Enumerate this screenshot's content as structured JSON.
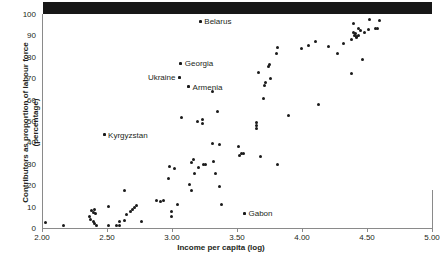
{
  "chart_data": {
    "type": "scatter",
    "title": "",
    "xlabel": "Income per capita (log)",
    "ylabel_line1": "Contributors as proportion of labour force",
    "ylabel_line2": "(percentage)",
    "xlim": [
      2.0,
      5.0
    ],
    "ylim": [
      0,
      100
    ],
    "xticks": [
      "2.00",
      "2.50",
      "3.00",
      "3.50",
      "4.00",
      "4.50",
      "5.00"
    ],
    "xtick_values": [
      2.0,
      2.5,
      3.0,
      3.5,
      4.0,
      4.5,
      5.0
    ],
    "yticks": [
      "0",
      "10",
      "20",
      "30",
      "40",
      "50",
      "60",
      "70",
      "80",
      "90",
      "100"
    ],
    "ytick_values": [
      0,
      10,
      20,
      30,
      40,
      50,
      60,
      70,
      80,
      90,
      100
    ],
    "grid": false,
    "legend": false,
    "marker_color": "#1a1a1a",
    "axis_color": "#8a8a8a",
    "annotations": [
      {
        "label": "Belarus",
        "x": 3.21,
        "y": 96.5,
        "side": "left"
      },
      {
        "label": "Georgia",
        "x": 3.06,
        "y": 77.0,
        "side": "left"
      },
      {
        "label": "Ukraine",
        "x": 3.05,
        "y": 70.5,
        "side": "right"
      },
      {
        "label": "Armenia",
        "x": 3.12,
        "y": 66.0,
        "side": "left"
      },
      {
        "label": "Kyrgyzstan",
        "x": 2.47,
        "y": 43.5,
        "side": "left"
      },
      {
        "label": "Gabon",
        "x": 3.55,
        "y": 7.0,
        "side": "left"
      }
    ],
    "points": [
      {
        "x": 2.02,
        "y": 2.8
      },
      {
        "x": 2.16,
        "y": 1.2
      },
      {
        "x": 2.355,
        "y": 5.2
      },
      {
        "x": 2.365,
        "y": 4.0
      },
      {
        "x": 2.375,
        "y": 8.2
      },
      {
        "x": 2.385,
        "y": 7.3
      },
      {
        "x": 2.385,
        "y": 3.2
      },
      {
        "x": 2.395,
        "y": 8.6
      },
      {
        "x": 2.395,
        "y": 2.3
      },
      {
        "x": 2.4,
        "y": 6.8
      },
      {
        "x": 2.41,
        "y": 1.0
      },
      {
        "x": 2.47,
        "y": 43.5
      },
      {
        "x": 2.5,
        "y": 9.9
      },
      {
        "x": 2.505,
        "y": 1.4
      },
      {
        "x": 2.565,
        "y": 1.2
      },
      {
        "x": 2.585,
        "y": 3.0
      },
      {
        "x": 2.59,
        "y": 1.1
      },
      {
        "x": 2.625,
        "y": 17.6
      },
      {
        "x": 2.625,
        "y": 3.6
      },
      {
        "x": 2.64,
        "y": 6.4
      },
      {
        "x": 2.675,
        "y": 7.9
      },
      {
        "x": 2.69,
        "y": 8.6
      },
      {
        "x": 2.705,
        "y": 9.4
      },
      {
        "x": 2.72,
        "y": 10.3
      },
      {
        "x": 2.755,
        "y": 3.1
      },
      {
        "x": 2.875,
        "y": 12.8
      },
      {
        "x": 2.9,
        "y": 12.6
      },
      {
        "x": 2.925,
        "y": 12.8
      },
      {
        "x": 2.965,
        "y": 23.3
      },
      {
        "x": 2.975,
        "y": 28.6
      },
      {
        "x": 2.985,
        "y": 7.6
      },
      {
        "x": 2.99,
        "y": 5.3
      },
      {
        "x": 3.015,
        "y": 27.9
      },
      {
        "x": 3.035,
        "y": 11.2
      },
      {
        "x": 3.06,
        "y": 77.0
      },
      {
        "x": 3.065,
        "y": 51.7
      },
      {
        "x": 3.05,
        "y": 70.5
      },
      {
        "x": 3.12,
        "y": 66.0
      },
      {
        "x": 3.125,
        "y": 20.4
      },
      {
        "x": 3.14,
        "y": 30.5
      },
      {
        "x": 3.145,
        "y": 17.3
      },
      {
        "x": 3.16,
        "y": 31.8
      },
      {
        "x": 3.165,
        "y": 25.5
      },
      {
        "x": 3.19,
        "y": 49.6
      },
      {
        "x": 3.195,
        "y": 28.5
      },
      {
        "x": 3.21,
        "y": 96.5
      },
      {
        "x": 3.225,
        "y": 50.8
      },
      {
        "x": 3.23,
        "y": 48.7
      },
      {
        "x": 3.235,
        "y": 29.5
      },
      {
        "x": 3.25,
        "y": 29.8
      },
      {
        "x": 3.305,
        "y": 63.9
      },
      {
        "x": 3.305,
        "y": 39.5
      },
      {
        "x": 3.31,
        "y": 30.9
      },
      {
        "x": 3.325,
        "y": 25.4
      },
      {
        "x": 3.34,
        "y": 54.6
      },
      {
        "x": 3.355,
        "y": 38.8
      },
      {
        "x": 3.36,
        "y": 19.6
      },
      {
        "x": 3.375,
        "y": 11.1
      },
      {
        "x": 3.5,
        "y": 38.2
      },
      {
        "x": 3.51,
        "y": 33.8
      },
      {
        "x": 3.53,
        "y": 35.0
      },
      {
        "x": 3.545,
        "y": 35.0
      },
      {
        "x": 3.55,
        "y": 7.0
      },
      {
        "x": 3.645,
        "y": 49.3
      },
      {
        "x": 3.645,
        "y": 47.8
      },
      {
        "x": 3.645,
        "y": 46.6
      },
      {
        "x": 3.655,
        "y": 72.6
      },
      {
        "x": 3.675,
        "y": 33.5
      },
      {
        "x": 3.695,
        "y": 60.5
      },
      {
        "x": 3.705,
        "y": 66.5
      },
      {
        "x": 3.715,
        "y": 68.0
      },
      {
        "x": 3.735,
        "y": 75.6
      },
      {
        "x": 3.745,
        "y": 76.2
      },
      {
        "x": 3.75,
        "y": 69.7
      },
      {
        "x": 3.795,
        "y": 81.7
      },
      {
        "x": 3.8,
        "y": 84.4
      },
      {
        "x": 3.805,
        "y": 29.5
      },
      {
        "x": 3.89,
        "y": 52.6
      },
      {
        "x": 3.985,
        "y": 83.7
      },
      {
        "x": 4.04,
        "y": 85.5
      },
      {
        "x": 4.095,
        "y": 87.3
      },
      {
        "x": 4.12,
        "y": 57.6
      },
      {
        "x": 4.195,
        "y": 84.9
      },
      {
        "x": 4.265,
        "y": 81.6
      },
      {
        "x": 4.315,
        "y": 86.3
      },
      {
        "x": 4.37,
        "y": 72.4
      },
      {
        "x": 4.375,
        "y": 88.0
      },
      {
        "x": 4.385,
        "y": 91.4
      },
      {
        "x": 4.39,
        "y": 95.4
      },
      {
        "x": 4.395,
        "y": 90.0
      },
      {
        "x": 4.405,
        "y": 91.1
      },
      {
        "x": 4.41,
        "y": 89.0
      },
      {
        "x": 4.415,
        "y": 89.3
      },
      {
        "x": 4.425,
        "y": 89.8
      },
      {
        "x": 4.43,
        "y": 93.0
      },
      {
        "x": 4.445,
        "y": 92.4
      },
      {
        "x": 4.46,
        "y": 78.8
      },
      {
        "x": 4.475,
        "y": 91.5
      },
      {
        "x": 4.5,
        "y": 92.9
      },
      {
        "x": 4.515,
        "y": 97.2
      },
      {
        "x": 4.56,
        "y": 93.2
      },
      {
        "x": 4.575,
        "y": 93.2
      },
      {
        "x": 4.585,
        "y": 97.0
      }
    ]
  }
}
